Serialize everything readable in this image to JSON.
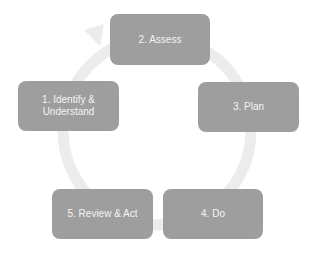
{
  "diagram": {
    "type": "cycle",
    "colors": {
      "box_fill": "#9e9e9e",
      "box_text": "#f4f4f4",
      "ring": "#ececec",
      "background": "#ffffff"
    },
    "steps": [
      {
        "label": "1. Identify & Understand"
      },
      {
        "label": "2. Assess"
      },
      {
        "label": "3. Plan"
      },
      {
        "label": "4. Do"
      },
      {
        "label": "5. Review & Act"
      }
    ]
  }
}
